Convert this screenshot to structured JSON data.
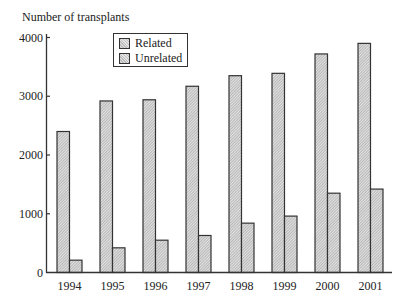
{
  "chart_data": {
    "type": "bar",
    "title": "",
    "ylabel": "Number of transplants",
    "xlabel": "",
    "categories": [
      "1994",
      "1995",
      "1996",
      "1997",
      "1998",
      "1999",
      "2000",
      "2001"
    ],
    "series": [
      {
        "name": "Related",
        "values": [
          2400,
          2920,
          2940,
          3170,
          3350,
          3390,
          3720,
          3900
        ]
      },
      {
        "name": "Unrelated",
        "values": [
          210,
          420,
          550,
          630,
          840,
          960,
          1350,
          1420
        ]
      }
    ],
    "ylim": [
      0,
      4000
    ],
    "yticks": [
      0,
      1000,
      2000,
      3000,
      4000
    ],
    "grid": false,
    "legend_position": "top-left-inside"
  },
  "legend": {
    "items": [
      "Related",
      "Unrelated"
    ]
  }
}
